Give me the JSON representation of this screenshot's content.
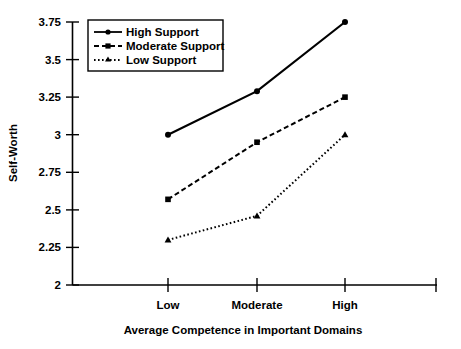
{
  "chart_data": {
    "type": "line",
    "title": "",
    "xlabel": "Average Competence in Important Domains",
    "ylabel": "Self-Worth",
    "categories": [
      "Low",
      "Moderate",
      "High"
    ],
    "ylim": [
      2,
      3.75
    ],
    "yticks": [
      "2",
      "2.25",
      "2.5",
      "2.75",
      "3",
      "3.25",
      "3.5",
      "3.75"
    ],
    "ytick_values": [
      2,
      2.25,
      2.5,
      2.75,
      3,
      3.25,
      3.5,
      3.75
    ],
    "grid": false,
    "legend_position": "top-left",
    "series": [
      {
        "name": "High Support",
        "values": [
          3.0,
          3.29,
          3.75
        ],
        "line_style": "solid",
        "marker": "circle",
        "color": "#000000"
      },
      {
        "name": "Moderate Support",
        "values": [
          2.57,
          2.95,
          3.25
        ],
        "line_style": "dashed",
        "marker": "square",
        "color": "#000000"
      },
      {
        "name": "Low Support",
        "values": [
          2.3,
          2.46,
          3.0
        ],
        "line_style": "dotted",
        "marker": "triangle",
        "color": "#000000"
      }
    ]
  },
  "axes": {
    "y_label": "Self-Worth",
    "x_label": "Average Competence in Important Domains",
    "y_tick_labels": [
      "3.75",
      "3.5",
      "3.25",
      "3",
      "2.75",
      "2.5",
      "2.25",
      "2"
    ],
    "x_tick_labels": [
      "Low",
      "Moderate",
      "High"
    ]
  },
  "legend": {
    "entries": [
      {
        "label": "High Support"
      },
      {
        "label": "Moderate Support"
      },
      {
        "label": "Low Support"
      }
    ]
  },
  "colors": {
    "ink": "#000000",
    "background": "#ffffff"
  }
}
